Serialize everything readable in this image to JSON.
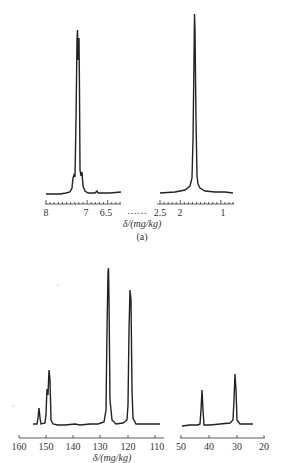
{
  "chart_data": [
    {
      "type": "line",
      "title": "",
      "panel_label": "(a)",
      "spectrum": "1H NMR",
      "xlabel": "δ/(mg/kg)",
      "x_reversed": true,
      "axis_break": "……",
      "segments": [
        {
          "xlim": [
            8.0,
            6.3
          ],
          "tick_labels": [
            "8",
            "7",
            "6.5"
          ],
          "tick_values": [
            8,
            7,
            6.5
          ],
          "peaks": [
            {
              "x": 7.26,
              "height": 1.0
            },
            {
              "x": 7.22,
              "height": 0.88
            },
            {
              "x": 7.35,
              "height": 0.14
            },
            {
              "x": 7.12,
              "height": 0.14
            }
          ]
        },
        {
          "xlim": [
            2.6,
            0.8
          ],
          "tick_labels": [
            "2.5",
            "2",
            "1"
          ],
          "tick_values": [
            2.5,
            2,
            1
          ],
          "peaks": [
            {
              "x": 1.55,
              "height": 1.0
            }
          ]
        }
      ],
      "grid": false,
      "legend": null
    },
    {
      "type": "line",
      "title": "",
      "spectrum": "13C NMR",
      "xlabel": "δ/(mg/kg)",
      "x_reversed": true,
      "segments": [
        {
          "xlim": [
            160,
            110
          ],
          "tick_labels": [
            "160",
            "150",
            "140",
            "130",
            "120",
            "110"
          ],
          "tick_values": [
            160,
            150,
            140,
            130,
            120,
            110
          ],
          "peaks": [
            {
              "x": 153,
              "height": 0.1
            },
            {
              "x": 149.5,
              "height": 0.23
            },
            {
              "x": 149,
              "height": 0.3
            },
            {
              "x": 128,
              "height": 1.0
            },
            {
              "x": 120,
              "height": 0.83
            }
          ]
        },
        {
          "xlim": [
            50,
            20
          ],
          "tick_labels": [
            "50",
            "40",
            "30",
            "20"
          ],
          "tick_values": [
            50,
            40,
            30,
            20
          ],
          "peaks": [
            {
              "x": 43,
              "height": 0.2
            },
            {
              "x": 31,
              "height": 0.27
            }
          ]
        }
      ],
      "grid": false,
      "legend": null
    }
  ],
  "labels": {
    "top_xlabel": "δ/(mg/kg)",
    "top_panel": "(a)",
    "top_break": "……",
    "bottom_xlabel": "δ/(mg/kg)",
    "top_ticks_left": [
      "8",
      "7",
      "6.5"
    ],
    "top_ticks_right": [
      "2.5",
      "2",
      "1"
    ],
    "bottom_ticks_left": [
      "160",
      "150",
      "140",
      "130",
      "120",
      "110"
    ],
    "bottom_ticks_right": [
      "50",
      "40",
      "30",
      "20"
    ]
  }
}
